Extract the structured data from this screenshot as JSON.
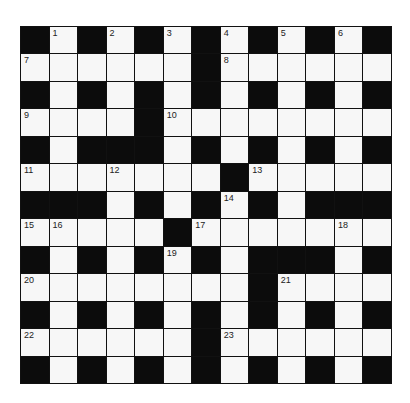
{
  "puzzle": {
    "rows": 13,
    "cols": 13,
    "colors": {
      "black": "#0c0c0c",
      "white": "#f7f7f7",
      "border": "#111111"
    },
    "grid": [
      "#.#.#.#.#.#.#",
      "......#......",
      "#.#.#.#.#.#.#",
      "....#........",
      "#.###.#.#.#.#",
      ".......#.....",
      "###.#.#.#.###",
      ".....#.......",
      "#.#.#.#.###.#",
      "........#....",
      "#.#.#.#.#.#.#",
      "......#......",
      "#.#.#.#.#.#.#"
    ],
    "numbers": [
      {
        "row": 0,
        "col": 1,
        "n": "1"
      },
      {
        "row": 0,
        "col": 3,
        "n": "2"
      },
      {
        "row": 0,
        "col": 5,
        "n": "3"
      },
      {
        "row": 0,
        "col": 7,
        "n": "4"
      },
      {
        "row": 0,
        "col": 9,
        "n": "5"
      },
      {
        "row": 0,
        "col": 11,
        "n": "6"
      },
      {
        "row": 1,
        "col": 0,
        "n": "7"
      },
      {
        "row": 1,
        "col": 7,
        "n": "8"
      },
      {
        "row": 3,
        "col": 0,
        "n": "9"
      },
      {
        "row": 3,
        "col": 5,
        "n": "10"
      },
      {
        "row": 5,
        "col": 0,
        "n": "11"
      },
      {
        "row": 5,
        "col": 3,
        "n": "12"
      },
      {
        "row": 5,
        "col": 8,
        "n": "13"
      },
      {
        "row": 6,
        "col": 7,
        "n": "14"
      },
      {
        "row": 7,
        "col": 0,
        "n": "15"
      },
      {
        "row": 7,
        "col": 1,
        "n": "16"
      },
      {
        "row": 7,
        "col": 6,
        "n": "17"
      },
      {
        "row": 7,
        "col": 11,
        "n": "18"
      },
      {
        "row": 8,
        "col": 5,
        "n": "19"
      },
      {
        "row": 9,
        "col": 0,
        "n": "20"
      },
      {
        "row": 9,
        "col": 9,
        "n": "21"
      },
      {
        "row": 11,
        "col": 0,
        "n": "22"
      },
      {
        "row": 11,
        "col": 7,
        "n": "23"
      }
    ]
  }
}
